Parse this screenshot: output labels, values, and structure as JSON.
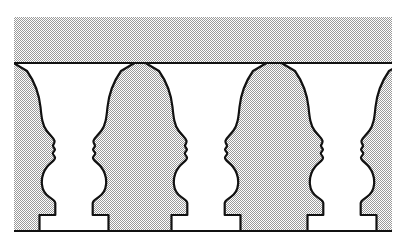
{
  "figure": {
    "name": "rubin-vase-faces-illusion",
    "title": "Rubin vase / facing profiles reversible figure",
    "width": 412,
    "height": 250,
    "caption": ""
  },
  "canvas": {
    "background_color": "#ffffff",
    "panel_color": "#d9d9d9",
    "panel_dot_color": "#b0b0b0",
    "figure_color": "#ffffff",
    "outline_color": "#111111",
    "outline_width": 2.2
  },
  "panel": {
    "x": 14,
    "y": 17,
    "width": 378,
    "height": 215,
    "rim_line_y": 63,
    "base_line_y": 231
  },
  "vases": [
    {
      "label": "vase-1",
      "partial": "left-clipped",
      "center_x": 74,
      "rim_left_x": 14,
      "rim_right_x": 135,
      "base_left_x": 40,
      "base_right_x": 110
    },
    {
      "label": "vase-2",
      "partial": "none",
      "center_x": 206,
      "rim_left_x": 137,
      "rim_right_x": 271,
      "base_left_x": 172,
      "base_right_x": 242
    },
    {
      "label": "vase-3",
      "partial": "right-clipped",
      "center_x": 342,
      "rim_left_x": 273,
      "rim_right_x": 392,
      "base_left_x": 302,
      "base_right_x": 385
    }
  ],
  "faces": [
    {
      "label": "face-1-right-facing",
      "direction": "right",
      "profile_x": 50
    },
    {
      "label": "face-2-left-facing",
      "direction": "left",
      "profile_x": 100
    },
    {
      "label": "face-3-right-facing",
      "direction": "right",
      "profile_x": 182
    },
    {
      "label": "face-4-left-facing",
      "direction": "left",
      "profile_x": 232
    },
    {
      "label": "face-5-right-facing",
      "direction": "right",
      "profile_x": 316
    },
    {
      "label": "face-6-left-facing",
      "direction": "left",
      "profile_x": 368
    }
  ],
  "features": {
    "forehead": "forehead",
    "brow": "brow-ridge",
    "nose": "nose",
    "upper_lip": "upper-lip",
    "mouth": "mouth",
    "lower_lip": "lower-lip",
    "chin": "chin",
    "neck": "neck"
  }
}
